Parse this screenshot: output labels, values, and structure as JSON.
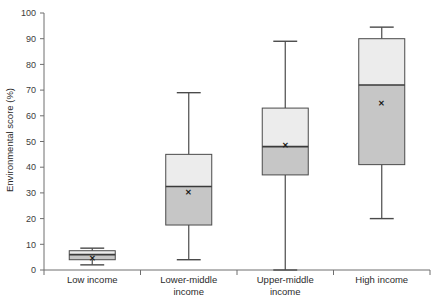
{
  "chart_data": {
    "type": "box",
    "title": "",
    "xlabel": "",
    "ylabel": "Environmental score (%)",
    "ylim": [
      0,
      100
    ],
    "ytick_step": 10,
    "yticks": [
      0,
      10,
      20,
      30,
      40,
      50,
      60,
      70,
      80,
      90,
      100
    ],
    "grid": false,
    "legend": "none",
    "categories": [
      "Low income",
      "Lower-middle income",
      "Upper-middle income",
      "High income"
    ],
    "category_label_lines": [
      [
        "Low income"
      ],
      [
        "Lower-middle",
        "income"
      ],
      [
        "Upper-middle",
        "income"
      ],
      [
        "High income"
      ]
    ],
    "boxes": [
      {
        "name": "Low income",
        "whisker_low": 2,
        "q1": 4,
        "median": 6,
        "q3": 7.5,
        "whisker_high": 8.5,
        "mean": 4.5
      },
      {
        "name": "Lower-middle income",
        "whisker_low": 4,
        "q1": 17.5,
        "median": 32.5,
        "q3": 45,
        "whisker_high": 69,
        "mean": 30.5
      },
      {
        "name": "Upper-middle income",
        "whisker_low": 0,
        "q1": 37,
        "median": 48,
        "q3": 63,
        "whisker_high": 89,
        "mean": 48.5
      },
      {
        "name": "High income",
        "whisker_low": 20,
        "q1": 41,
        "median": 72,
        "q3": 90,
        "whisker_high": 94.5,
        "mean": 65
      }
    ],
    "mean_marker_symbol": "✕",
    "colors": {
      "lower_box_fill": "#c6c6c6",
      "upper_box_fill": "#ececec",
      "box_stroke": "#4a4a4a",
      "whisker": "#4a4a4a",
      "median": "#3a3a3a",
      "axis": "#6e6e6e",
      "text": "#2b2b2b"
    }
  }
}
